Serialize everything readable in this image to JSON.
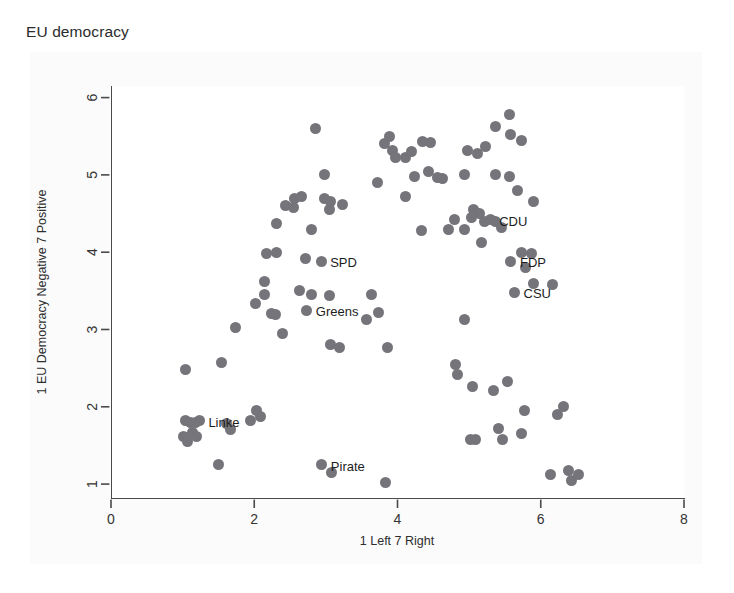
{
  "chart_data": {
    "type": "scatter",
    "title": "EU democracy",
    "xlabel": "1 Left 7 Right",
    "ylabel": "1 EU Democracy Negative 7 Positive",
    "xlim": [
      0,
      8
    ],
    "ylim": [
      0.82,
      6.15
    ],
    "xticks": [
      0,
      2,
      4,
      6,
      8
    ],
    "yticks": [
      1,
      2,
      3,
      4,
      5,
      6
    ],
    "xtick_labels": [
      "0",
      "2",
      "4",
      "6",
      "8"
    ],
    "ytick_labels": [
      "1",
      "2",
      "3",
      "4",
      "5",
      "6"
    ],
    "grid": false,
    "legend": "none",
    "marker_color": "#74747a",
    "marker_size_px": 11,
    "annotations": [
      {
        "label": "CDU",
        "x": 5.28,
        "y": 4.42
      },
      {
        "label": "SPD",
        "x": 2.92,
        "y": 3.88
      },
      {
        "label": "FDP",
        "x": 5.57,
        "y": 3.88
      },
      {
        "label": "CSU",
        "x": 5.62,
        "y": 3.48
      },
      {
        "label": "Greens",
        "x": 2.72,
        "y": 3.25
      },
      {
        "label": "Linke",
        "x": 1.22,
        "y": 1.82
      },
      {
        "label": "Pirate",
        "x": 2.93,
        "y": 1.25
      }
    ],
    "points": [
      {
        "x": 1.02,
        "y": 2.48
      },
      {
        "x": 1.53,
        "y": 2.57
      },
      {
        "x": 1.72,
        "y": 3.02
      },
      {
        "x": 2.0,
        "y": 3.34
      },
      {
        "x": 2.13,
        "y": 3.45
      },
      {
        "x": 2.22,
        "y": 3.21
      },
      {
        "x": 2.28,
        "y": 3.2
      },
      {
        "x": 2.13,
        "y": 3.62
      },
      {
        "x": 2.16,
        "y": 3.98
      },
      {
        "x": 2.3,
        "y": 4.0
      },
      {
        "x": 2.3,
        "y": 4.37
      },
      {
        "x": 2.55,
        "y": 4.7
      },
      {
        "x": 2.65,
        "y": 4.72
      },
      {
        "x": 2.42,
        "y": 4.6
      },
      {
        "x": 2.53,
        "y": 4.58
      },
      {
        "x": 2.84,
        "y": 5.6
      },
      {
        "x": 2.97,
        "y": 5.0
      },
      {
        "x": 2.97,
        "y": 4.7
      },
      {
        "x": 3.05,
        "y": 4.66
      },
      {
        "x": 3.03,
        "y": 4.55
      },
      {
        "x": 3.22,
        "y": 4.62
      },
      {
        "x": 2.79,
        "y": 4.3
      },
      {
        "x": 2.7,
        "y": 3.92
      },
      {
        "x": 2.78,
        "y": 3.45
      },
      {
        "x": 2.62,
        "y": 3.5
      },
      {
        "x": 3.03,
        "y": 3.44
      },
      {
        "x": 2.38,
        "y": 2.95
      },
      {
        "x": 3.05,
        "y": 2.8
      },
      {
        "x": 3.18,
        "y": 2.77
      },
      {
        "x": 3.55,
        "y": 3.13
      },
      {
        "x": 3.62,
        "y": 3.45
      },
      {
        "x": 3.72,
        "y": 3.22
      },
      {
        "x": 3.85,
        "y": 2.77
      },
      {
        "x": 3.7,
        "y": 4.9
      },
      {
        "x": 3.8,
        "y": 5.4
      },
      {
        "x": 3.88,
        "y": 5.5
      },
      {
        "x": 3.92,
        "y": 5.32
      },
      {
        "x": 3.96,
        "y": 5.22
      },
      {
        "x": 4.1,
        "y": 5.22
      },
      {
        "x": 4.18,
        "y": 5.3
      },
      {
        "x": 4.33,
        "y": 5.43
      },
      {
        "x": 4.44,
        "y": 5.42
      },
      {
        "x": 4.22,
        "y": 4.98
      },
      {
        "x": 4.42,
        "y": 5.05
      },
      {
        "x": 4.55,
        "y": 4.97
      },
      {
        "x": 4.1,
        "y": 4.72
      },
      {
        "x": 4.32,
        "y": 4.28
      },
      {
        "x": 4.62,
        "y": 4.95
      },
      {
        "x": 4.92,
        "y": 5.0
      },
      {
        "x": 4.96,
        "y": 5.32
      },
      {
        "x": 5.1,
        "y": 5.28
      },
      {
        "x": 5.22,
        "y": 5.37
      },
      {
        "x": 5.35,
        "y": 5.62
      },
      {
        "x": 5.55,
        "y": 5.78
      },
      {
        "x": 5.57,
        "y": 5.52
      },
      {
        "x": 5.72,
        "y": 5.45
      },
      {
        "x": 5.35,
        "y": 5.0
      },
      {
        "x": 5.55,
        "y": 4.98
      },
      {
        "x": 5.66,
        "y": 4.8
      },
      {
        "x": 5.88,
        "y": 4.66
      },
      {
        "x": 5.05,
        "y": 4.55
      },
      {
        "x": 5.13,
        "y": 4.5
      },
      {
        "x": 5.02,
        "y": 4.45
      },
      {
        "x": 5.2,
        "y": 4.4
      },
      {
        "x": 5.36,
        "y": 4.4
      },
      {
        "x": 5.44,
        "y": 4.32
      },
      {
        "x": 5.16,
        "y": 4.12
      },
      {
        "x": 4.92,
        "y": 4.3
      },
      {
        "x": 4.78,
        "y": 4.42
      },
      {
        "x": 4.7,
        "y": 4.3
      },
      {
        "x": 5.72,
        "y": 4.0
      },
      {
        "x": 5.86,
        "y": 3.98
      },
      {
        "x": 5.78,
        "y": 3.8
      },
      {
        "x": 5.88,
        "y": 3.6
      },
      {
        "x": 6.15,
        "y": 3.58
      },
      {
        "x": 4.92,
        "y": 3.13
      },
      {
        "x": 4.8,
        "y": 2.55
      },
      {
        "x": 4.82,
        "y": 2.42
      },
      {
        "x": 5.04,
        "y": 2.26
      },
      {
        "x": 5.32,
        "y": 2.21
      },
      {
        "x": 5.52,
        "y": 2.33
      },
      {
        "x": 5.76,
        "y": 1.95
      },
      {
        "x": 6.22,
        "y": 1.9
      },
      {
        "x": 6.3,
        "y": 2.0
      },
      {
        "x": 5.0,
        "y": 1.58
      },
      {
        "x": 5.08,
        "y": 1.58
      },
      {
        "x": 5.4,
        "y": 1.72
      },
      {
        "x": 5.45,
        "y": 1.58
      },
      {
        "x": 5.72,
        "y": 1.65
      },
      {
        "x": 6.12,
        "y": 1.12
      },
      {
        "x": 6.38,
        "y": 1.18
      },
      {
        "x": 6.42,
        "y": 1.05
      },
      {
        "x": 6.52,
        "y": 1.12
      },
      {
        "x": 1.03,
        "y": 1.82
      },
      {
        "x": 1.1,
        "y": 1.8
      },
      {
        "x": 1.17,
        "y": 1.8
      },
      {
        "x": 1.0,
        "y": 1.62
      },
      {
        "x": 1.06,
        "y": 1.55
      },
      {
        "x": 1.12,
        "y": 1.67
      },
      {
        "x": 1.18,
        "y": 1.62
      },
      {
        "x": 1.48,
        "y": 1.25
      },
      {
        "x": 1.6,
        "y": 1.78
      },
      {
        "x": 1.66,
        "y": 1.7
      },
      {
        "x": 1.94,
        "y": 1.82
      },
      {
        "x": 2.08,
        "y": 1.88
      },
      {
        "x": 2.02,
        "y": 1.95
      },
      {
        "x": 3.06,
        "y": 1.15
      },
      {
        "x": 3.82,
        "y": 1.02
      }
    ]
  }
}
